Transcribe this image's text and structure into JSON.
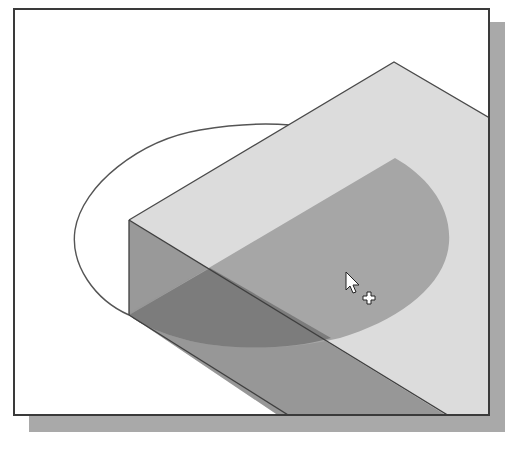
{
  "viewport": {
    "title": "3D model viewport",
    "background": "#ffffff",
    "frame_color": "#3a3a3a",
    "shadow_color": "#a9a9a9"
  },
  "model": {
    "description": "Isometric rectangular block with a semicircular (half-ellipse) sketch region being extruded/cut from the corner",
    "colors": {
      "top_face": "#dcdcdc",
      "front_face": "#979797",
      "selected_region_top": "#a6a6a6",
      "selected_region_front": "#7c7c7c",
      "edge": "#4a4a4a",
      "ellipse_outline": "#555555"
    }
  },
  "cursor": {
    "type": "arrow-with-plus",
    "x": 346,
    "y": 275
  }
}
